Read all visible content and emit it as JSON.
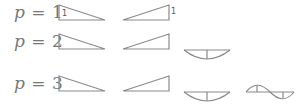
{
  "rows": [
    {
      "label": "p = 1",
      "var": "p",
      "eq": " = ",
      "order": "1",
      "shapes": [
        "linear-decreasing",
        "linear-increasing"
      ],
      "unit_marker": "1"
    },
    {
      "label": "p = 2",
      "var": "p",
      "eq": " = ",
      "order": "2",
      "shapes": [
        "linear-decreasing",
        "linear-increasing",
        "quadratic-bubble"
      ]
    },
    {
      "label": "p = 3",
      "var": "p",
      "eq": " = ",
      "order": "3",
      "shapes": [
        "linear-decreasing",
        "linear-increasing",
        "quadratic-bubble",
        "cubic-bubble"
      ]
    }
  ],
  "colors": {
    "stroke": "#888888",
    "text": "#777777"
  }
}
